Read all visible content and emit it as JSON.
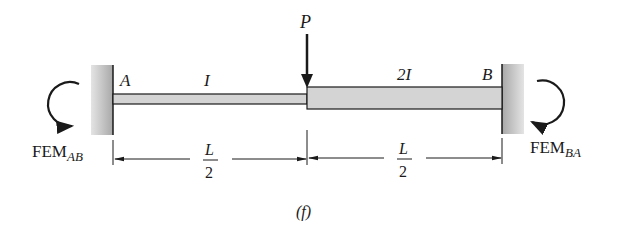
{
  "diagram": {
    "load_label": "P",
    "left_support_label": "A",
    "right_support_label": "B",
    "left_segment_inertia": "I",
    "right_segment_inertia": "2I",
    "left_moment": {
      "main": "FEM",
      "sub": "AB"
    },
    "right_moment": {
      "main": "FEM",
      "sub": "BA"
    },
    "dim_left": {
      "num": "L",
      "den": "2"
    },
    "dim_right": {
      "num": "L",
      "den": "2"
    },
    "caption": "(f)"
  },
  "colors": {
    "ink": "#1a1a1a",
    "beam_fill": "#d4d4d4",
    "wall_fill": "#b8b8b8"
  }
}
